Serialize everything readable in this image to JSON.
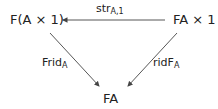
{
  "diagram": {
    "nodes": {
      "top_left": "F(A × 1)",
      "top_right": "FA × 1",
      "bottom": "FA"
    },
    "arrows": {
      "top": {
        "label": "str",
        "sub": "A,1",
        "from": "FA × 1",
        "to": "F(A × 1)"
      },
      "left": {
        "label": "Frid",
        "sub": "A",
        "from": "F(A × 1)",
        "to": "FA"
      },
      "right": {
        "label": "ridF",
        "sub": "A",
        "from": "FA × 1",
        "to": "FA"
      }
    },
    "colors": {
      "line": "#444444",
      "text": "#222222"
    }
  }
}
